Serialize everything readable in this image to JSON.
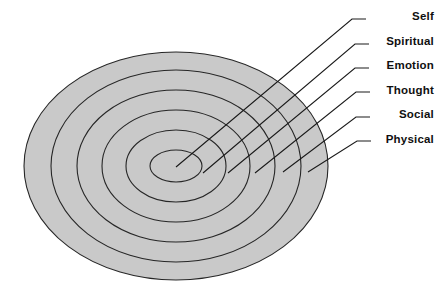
{
  "diagram": {
    "type": "concentric-ellipses",
    "fill_color": "#c9c9c9",
    "stroke_color": "#262626",
    "background_color": "#ffffff",
    "label_color": "#101010",
    "center": {
      "x": 176,
      "y": 166
    },
    "rings": [
      {
        "index": 0,
        "label": "Self",
        "level": "innermost",
        "rx": 26,
        "ry": 16,
        "label_y": 10,
        "leader": {
          "x1": 176,
          "y1": 167,
          "x2": 352,
          "y2": 19,
          "tick_x": 366
        }
      },
      {
        "index": 1,
        "label": "Spiritual",
        "level": "2",
        "rx": 50,
        "ry": 36,
        "label_y": 35,
        "leader": {
          "x1": 203,
          "y1": 173,
          "x2": 355,
          "y2": 44,
          "tick_x": 369
        }
      },
      {
        "index": 2,
        "label": "Emotion",
        "level": "3",
        "rx": 74,
        "ry": 56,
        "label_y": 59,
        "leader": {
          "x1": 228,
          "y1": 173,
          "x2": 355,
          "y2": 68,
          "tick_x": 369
        }
      },
      {
        "index": 3,
        "label": "Thought",
        "level": "4",
        "rx": 99,
        "ry": 76,
        "label_y": 84,
        "leader": {
          "x1": 255,
          "y1": 173,
          "x2": 356,
          "y2": 92,
          "tick_x": 370
        }
      },
      {
        "index": 4,
        "label": "Social",
        "level": "5",
        "rx": 125,
        "ry": 96,
        "label_y": 108,
        "leader": {
          "x1": 283,
          "y1": 172,
          "x2": 356,
          "y2": 117,
          "tick_x": 370
        }
      },
      {
        "index": 5,
        "label": "Physical",
        "level": "outermost",
        "rx": 152,
        "ry": 114,
        "label_y": 133,
        "leader": {
          "x1": 308,
          "y1": 172,
          "x2": 357,
          "y2": 141,
          "tick_x": 371
        }
      }
    ]
  }
}
